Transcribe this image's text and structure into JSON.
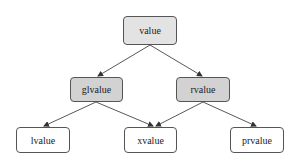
{
  "diagram": {
    "type": "tree",
    "nodes": [
      {
        "id": "value",
        "label": "value",
        "level": 0,
        "fill": "#e3e3e3"
      },
      {
        "id": "glvalue",
        "label": "glvalue",
        "level": 1,
        "fill": "#d2d2d2"
      },
      {
        "id": "rvalue",
        "label": "rvalue",
        "level": 1,
        "fill": "#d2d2d2"
      },
      {
        "id": "lvalue",
        "label": "lvalue",
        "level": 2,
        "fill": "#ffffff"
      },
      {
        "id": "xvalue",
        "label": "xvalue",
        "level": 2,
        "fill": "#ffffff"
      },
      {
        "id": "prvalue",
        "label": "prvalue",
        "level": 2,
        "fill": "#ffffff"
      }
    ],
    "edges": [
      {
        "from": "value",
        "to": "glvalue"
      },
      {
        "from": "value",
        "to": "rvalue"
      },
      {
        "from": "glvalue",
        "to": "lvalue"
      },
      {
        "from": "glvalue",
        "to": "xvalue"
      },
      {
        "from": "rvalue",
        "to": "xvalue"
      },
      {
        "from": "rvalue",
        "to": "prvalue"
      }
    ],
    "colors": {
      "edge": "#444444",
      "border": "#555555"
    }
  }
}
